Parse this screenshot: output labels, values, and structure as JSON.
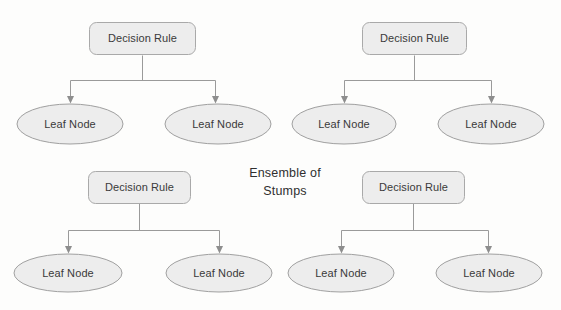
{
  "figure": {
    "title": "Ensemble of Stumps",
    "center_label_lines": [
      "Ensemble of",
      "Stumps"
    ],
    "background_color": "#fdfdfc",
    "node_fill_color": "#ededed",
    "node_border_color": "#a9a9a9",
    "connector_color": "#9a9a9a",
    "text_color": "#3a3a3a"
  },
  "stumps": [
    {
      "id": "stump-top-left",
      "root": {
        "label": "Decision Rule"
      },
      "leaves": [
        {
          "label": "Leaf Node"
        },
        {
          "label": "Leaf Node"
        }
      ]
    },
    {
      "id": "stump-top-right",
      "root": {
        "label": "Decision Rule"
      },
      "leaves": [
        {
          "label": "Leaf Node"
        },
        {
          "label": "Leaf Node"
        }
      ]
    },
    {
      "id": "stump-bottom-left",
      "root": {
        "label": "Decision Rule"
      },
      "leaves": [
        {
          "label": "Leaf Node"
        },
        {
          "label": "Leaf Node"
        }
      ]
    },
    {
      "id": "stump-bottom-right",
      "root": {
        "label": "Decision Rule"
      },
      "leaves": [
        {
          "label": "Leaf Node"
        },
        {
          "label": "Leaf Node"
        }
      ]
    }
  ]
}
